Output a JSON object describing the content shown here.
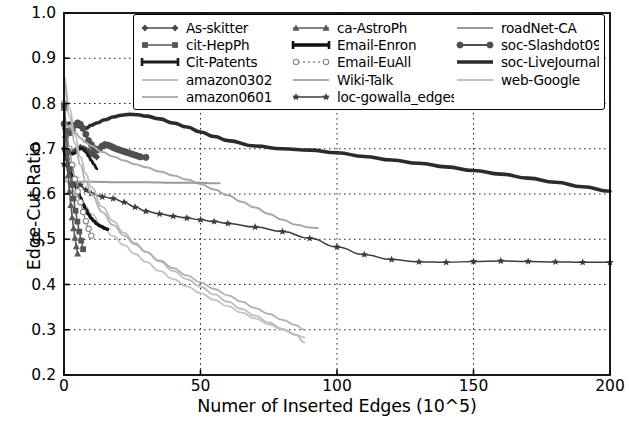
{
  "chart": {
    "type": "line",
    "title": "",
    "xlabel": "Numer of Inserted Edges (10^5)",
    "ylabel": "Edge-Cut Ratio",
    "xlim": [
      0,
      200
    ],
    "ylim": [
      0.2,
      1.0
    ],
    "xticks": [
      "0",
      "50",
      "100",
      "150",
      "200"
    ],
    "xtick_values": [
      0,
      50,
      100,
      150,
      200
    ],
    "yticks": [
      "0.2",
      "0.3",
      "0.4",
      "0.5",
      "0.6",
      "0.7",
      "0.8",
      "0.9",
      "1.0"
    ],
    "ytick_values": [
      0.2,
      0.3,
      0.4,
      0.5,
      0.6,
      0.7,
      0.8,
      0.9,
      1.0
    ],
    "grid": "dotted",
    "legend_position": "upper center",
    "legend_columns": 3
  },
  "legend": {
    "columns": [
      [
        {
          "label": "As-skitter",
          "marker": "diamond",
          "color": "#4a4a4a",
          "linewidth": 1.6
        },
        {
          "label": "cit-HepPh",
          "marker": "square",
          "color": "#555555",
          "linewidth": 1.6
        },
        {
          "label": "Cit-Patents",
          "marker": "bar",
          "color": "#1a1a1a",
          "linewidth": 3.0
        },
        {
          "label": "amazon0302",
          "marker": "none",
          "color": "#bdbdbd",
          "linewidth": 1.8
        },
        {
          "label": "amazon0601",
          "marker": "none",
          "color": "#b0b0b0",
          "linewidth": 1.8
        }
      ],
      [
        {
          "label": "ca-AstroPh",
          "marker": "triangle",
          "color": "#5a5a5a",
          "linewidth": 1.6
        },
        {
          "label": "Email-Enron",
          "marker": "bar",
          "color": "#111111",
          "linewidth": 3.4
        },
        {
          "label": "Email-EuAll",
          "marker": "circle-open",
          "color": "#8a8a8a",
          "linewidth": 1.3
        },
        {
          "label": "Wiki-Talk",
          "marker": "none",
          "color": "#a8a8a8",
          "linewidth": 2.0
        },
        {
          "label": "loc-gowalla_edges",
          "marker": "star",
          "color": "#3c3c3c",
          "linewidth": 1.5
        }
      ],
      [
        {
          "label": "roadNet-CA",
          "marker": "none",
          "color": "#9a9a9a",
          "linewidth": 2.0
        },
        {
          "label": "soc-Slashdot0902",
          "marker": "circle",
          "color": "#4f4f4f",
          "linewidth": 1.8
        },
        {
          "label": "soc-LiveJournal1",
          "marker": "none",
          "color": "#2b2b2b",
          "linewidth": 3.6
        },
        {
          "label": "web-Google",
          "marker": "none",
          "color": "#c2c2c2",
          "linewidth": 1.8
        }
      ]
    ]
  },
  "chart_data": {
    "type": "line",
    "title": "",
    "xlabel": "Numer of Inserted Edges (10^5)",
    "ylabel": "Edge-Cut Ratio",
    "xlim": [
      0,
      200
    ],
    "ylim": [
      0.2,
      1.0
    ],
    "xticks": [
      0,
      50,
      100,
      150,
      200
    ],
    "yticks": [
      0.2,
      0.3,
      0.4,
      0.5,
      0.6,
      0.7,
      0.8,
      0.9,
      1.0
    ],
    "grid": true,
    "legend_position": "upper center",
    "series": [
      {
        "name": "soc-LiveJournal1",
        "color": "#2b2b2b",
        "linewidth": 3.6,
        "marker": "none",
        "x": [
          0,
          2,
          4,
          6,
          8,
          10,
          12,
          15,
          18,
          21,
          24,
          27,
          30,
          35,
          40,
          45,
          50,
          55,
          60,
          70,
          80,
          90,
          100,
          110,
          120,
          130,
          140,
          150,
          160,
          170,
          180,
          190,
          200
        ],
        "y": [
          0.745,
          0.757,
          0.753,
          0.748,
          0.745,
          0.752,
          0.757,
          0.764,
          0.77,
          0.774,
          0.776,
          0.775,
          0.772,
          0.766,
          0.757,
          0.748,
          0.737,
          0.727,
          0.718,
          0.706,
          0.7,
          0.697,
          0.691,
          0.683,
          0.675,
          0.668,
          0.66,
          0.652,
          0.644,
          0.635,
          0.626,
          0.616,
          0.606
        ]
      },
      {
        "name": "soc-Slashdot0902",
        "color": "#4f4f4f",
        "linewidth": 1.8,
        "marker": "circle",
        "x": [
          0,
          1,
          2,
          3,
          4,
          5,
          6,
          7,
          8,
          9,
          10,
          11,
          12,
          13,
          14,
          15,
          16,
          17,
          18,
          19,
          20,
          21,
          22,
          23,
          24,
          25,
          26,
          27,
          28,
          30
        ],
        "y": [
          0.755,
          0.742,
          0.735,
          0.74,
          0.752,
          0.757,
          0.754,
          0.745,
          0.732,
          0.718,
          0.709,
          0.701,
          0.697,
          0.7,
          0.706,
          0.709,
          0.708,
          0.706,
          0.703,
          0.7,
          0.698,
          0.696,
          0.694,
          0.692,
          0.69,
          0.688,
          0.686,
          0.684,
          0.682,
          0.681
        ]
      },
      {
        "name": "As-skitter",
        "color": "#4a4a4a",
        "linewidth": 1.6,
        "marker": "diamond",
        "x": [
          0,
          1,
          2,
          3,
          4,
          5,
          6,
          7,
          8,
          9,
          10,
          11,
          12
        ],
        "y": [
          0.7,
          0.697,
          0.694,
          0.692,
          0.695,
          0.7,
          0.703,
          0.701,
          0.698,
          0.694,
          0.69,
          0.686,
          0.682
        ]
      },
      {
        "name": "Cit-Patents",
        "color": "#1a1a1a",
        "linewidth": 3.0,
        "marker": "bar",
        "x": [
          0,
          1,
          2,
          3,
          4,
          5,
          6,
          7,
          8,
          9,
          10,
          11,
          12
        ],
        "y": [
          0.694,
          0.693,
          0.691,
          0.689,
          0.69,
          0.697,
          0.702,
          0.7,
          0.693,
          0.684,
          0.674,
          0.665,
          0.656
        ]
      },
      {
        "name": "Wiki-Talk",
        "color": "#a8a8a8",
        "linewidth": 2.0,
        "marker": "none",
        "x": [
          0,
          2,
          4,
          6,
          8,
          10,
          14,
          18,
          22,
          26,
          30,
          35,
          40,
          45,
          50,
          55,
          60,
          65,
          70,
          75,
          80,
          85,
          90,
          93
        ],
        "y": [
          0.758,
          0.748,
          0.736,
          0.724,
          0.714,
          0.706,
          0.693,
          0.683,
          0.674,
          0.666,
          0.659,
          0.65,
          0.641,
          0.632,
          0.622,
          0.61,
          0.597,
          0.583,
          0.57,
          0.556,
          0.543,
          0.532,
          0.526,
          0.525
        ]
      },
      {
        "name": "loc-gowalla_edges",
        "color": "#3c3c3c",
        "linewidth": 1.5,
        "marker": "star",
        "x": [
          0,
          2,
          4,
          6,
          8,
          10,
          14,
          18,
          22,
          26,
          30,
          35,
          40,
          45,
          50,
          55,
          60,
          70,
          80,
          90,
          100,
          110,
          120,
          130,
          140,
          150,
          160,
          170,
          180,
          190,
          200
        ],
        "y": [
          0.666,
          0.651,
          0.634,
          0.62,
          0.609,
          0.601,
          0.594,
          0.59,
          0.582,
          0.571,
          0.562,
          0.556,
          0.551,
          0.547,
          0.543,
          0.539,
          0.535,
          0.527,
          0.517,
          0.502,
          0.483,
          0.466,
          0.455,
          0.45,
          0.449,
          0.451,
          0.452,
          0.451,
          0.45,
          0.449,
          0.449
        ]
      },
      {
        "name": "roadNet-CA",
        "color": "#9a9a9a",
        "linewidth": 2.0,
        "marker": "none",
        "x": [
          0,
          5,
          10,
          20,
          30,
          40,
          50,
          55,
          57
        ],
        "y": [
          0.628,
          0.627,
          0.627,
          0.626,
          0.626,
          0.625,
          0.625,
          0.624,
          0.624
        ]
      },
      {
        "name": "web-Google",
        "color": "#c2c2c2",
        "linewidth": 1.8,
        "marker": "none",
        "x": [
          0,
          2,
          4,
          6,
          8,
          10,
          14,
          18,
          22,
          26,
          30,
          35,
          40,
          45,
          50,
          55,
          60,
          65,
          70,
          75,
          80,
          85,
          88
        ],
        "y": [
          0.636,
          0.622,
          0.606,
          0.589,
          0.572,
          0.556,
          0.53,
          0.507,
          0.487,
          0.468,
          0.45,
          0.43,
          0.412,
          0.396,
          0.381,
          0.366,
          0.352,
          0.338,
          0.325,
          0.312,
          0.3,
          0.289,
          0.283
        ]
      },
      {
        "name": "amazon0302",
        "color": "#bdbdbd",
        "linewidth": 1.8,
        "marker": "none",
        "x": [
          0,
          2,
          4,
          6,
          8,
          10,
          14,
          18,
          22,
          26,
          30,
          35,
          40,
          45,
          50,
          55,
          60,
          65,
          70,
          75,
          80,
          85,
          88
        ],
        "y": [
          0.86,
          0.79,
          0.73,
          0.682,
          0.645,
          0.615,
          0.572,
          0.54,
          0.514,
          0.492,
          0.472,
          0.451,
          0.43,
          0.412,
          0.395,
          0.378,
          0.362,
          0.346,
          0.331,
          0.316,
          0.302,
          0.288,
          0.272
        ]
      },
      {
        "name": "amazon0601",
        "color": "#b0b0b0",
        "linewidth": 1.8,
        "marker": "none",
        "x": [
          0,
          2,
          4,
          6,
          8,
          10,
          14,
          18,
          22,
          26,
          30,
          35,
          40,
          45,
          50,
          55,
          60,
          65,
          70,
          75,
          80,
          85,
          88
        ],
        "y": [
          0.845,
          0.772,
          0.712,
          0.664,
          0.628,
          0.6,
          0.56,
          0.531,
          0.508,
          0.489,
          0.472,
          0.453,
          0.436,
          0.42,
          0.405,
          0.39,
          0.376,
          0.362,
          0.348,
          0.335,
          0.322,
          0.31,
          0.3
        ]
      },
      {
        "name": "Email-Enron",
        "color": "#111111",
        "linewidth": 3.4,
        "marker": "bar",
        "x": [
          0,
          1,
          2,
          3,
          4,
          5,
          6,
          7,
          8,
          9,
          10,
          11,
          12,
          13,
          14,
          15,
          16
        ],
        "y": [
          0.7,
          0.676,
          0.655,
          0.637,
          0.622,
          0.607,
          0.592,
          0.578,
          0.566,
          0.555,
          0.546,
          0.54,
          0.534,
          0.53,
          0.527,
          0.524,
          0.522
        ]
      },
      {
        "name": "Email-EuAll",
        "color": "#8a8a8a",
        "linewidth": 1.3,
        "marker": "circle-open",
        "x": [
          0,
          1,
          2,
          3,
          4,
          5,
          6,
          7,
          8,
          9,
          10
        ],
        "y": [
          0.8,
          0.745,
          0.7,
          0.664,
          0.633,
          0.606,
          0.582,
          0.56,
          0.54,
          0.523,
          0.508
        ]
      },
      {
        "name": "cit-HepPh",
        "color": "#555555",
        "linewidth": 1.6,
        "marker": "square",
        "x": [
          0,
          0.7,
          1.4,
          2.1,
          2.8,
          3.5,
          4.2,
          4.9,
          5.6,
          6.3,
          7.0
        ],
        "y": [
          0.795,
          0.74,
          0.694,
          0.655,
          0.62,
          0.59,
          0.563,
          0.539,
          0.517,
          0.497,
          0.478
        ]
      },
      {
        "name": "ca-AstroPh",
        "color": "#5a5a5a",
        "linewidth": 1.6,
        "marker": "triangle",
        "x": [
          0,
          0.5,
          1.0,
          1.5,
          2.0,
          2.5,
          3.0,
          3.5,
          4.0,
          4.5,
          5.0
        ],
        "y": [
          0.79,
          0.73,
          0.682,
          0.641,
          0.606,
          0.575,
          0.548,
          0.524,
          0.503,
          0.484,
          0.468
        ]
      }
    ]
  }
}
